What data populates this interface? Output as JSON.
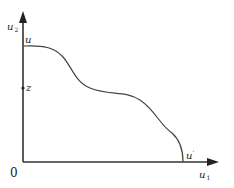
{
  "diagram": {
    "y_axis_label": {
      "main": "u",
      "sub": "2"
    },
    "x_axis_label": {
      "main": "u",
      "sub": "1"
    },
    "origin_label": "0",
    "curve_start_label": "u",
    "z_label": "z",
    "curve_end_label": {
      "main": "u",
      "sup": "'"
    },
    "colors": {
      "axis": "#333333",
      "curve": "#444444"
    }
  }
}
